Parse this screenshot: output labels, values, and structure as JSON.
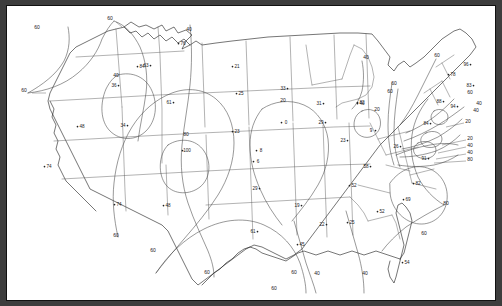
{
  "figure": {
    "type": "contour-map",
    "region": "Contiguous United States",
    "frame_color": "#3d3d3d",
    "background_color": "#ffffff",
    "line_color": "#1a1a1a"
  },
  "chart_data": {
    "type": "contour-map",
    "title": "",
    "subtitle": "",
    "xlabel": "",
    "ylabel": "",
    "grid": false,
    "legend": "none",
    "region": "Contiguous United States",
    "contour_interval": 20,
    "contour_levels": [
      0,
      20,
      40,
      60,
      80
    ],
    "value_range": [
      0,
      100
    ],
    "stations": [
      {
        "label": "76",
        "value": 76,
        "x": 177,
        "y": 40,
        "dot": "left"
      },
      {
        "label": "84",
        "value": 84,
        "x": 136,
        "y": 63,
        "dot": "left"
      },
      {
        "label": "36",
        "value": 36,
        "x": 108,
        "y": 82,
        "dot": "right"
      },
      {
        "label": "63",
        "value": 63,
        "x": 140,
        "y": 62,
        "dot": "right"
      },
      {
        "label": "21",
        "value": 21,
        "x": 231,
        "y": 63,
        "dot": "left"
      },
      {
        "label": "61",
        "value": 61,
        "x": 163,
        "y": 99,
        "dot": "right"
      },
      {
        "label": "25",
        "value": 25,
        "x": 235,
        "y": 90,
        "dot": "left"
      },
      {
        "label": "33",
        "value": 33,
        "x": 277,
        "y": 85,
        "dot": "right"
      },
      {
        "label": "31",
        "value": 31,
        "x": 313,
        "y": 100,
        "dot": "right"
      },
      {
        "label": "40",
        "value": 40,
        "x": 356,
        "y": 100,
        "dot": "left"
      },
      {
        "label": "48",
        "value": 48,
        "x": 76,
        "y": 123,
        "dot": "left"
      },
      {
        "label": "34",
        "value": 34,
        "x": 117,
        "y": 122,
        "dot": "right"
      },
      {
        "label": "23",
        "value": 23,
        "x": 231,
        "y": 128,
        "dot": "left"
      },
      {
        "label": "0",
        "value": 0,
        "x": 280,
        "y": 119,
        "dot": "left"
      },
      {
        "label": "29",
        "value": 29,
        "x": 315,
        "y": 119,
        "dot": "right"
      },
      {
        "label": "23",
        "value": 23,
        "x": 337,
        "y": 137,
        "dot": "right"
      },
      {
        "label": "9",
        "value": 9,
        "x": 365,
        "y": 127,
        "dot": "right"
      },
      {
        "label": "100",
        "value": 100,
        "x": 181,
        "y": 147,
        "dot": "left"
      },
      {
        "label": "8",
        "value": 8,
        "x": 255,
        "y": 147,
        "dot": "left"
      },
      {
        "label": "6",
        "value": 6,
        "x": 252,
        "y": 158,
        "dot": "left"
      },
      {
        "label": "26",
        "value": 26,
        "x": 390,
        "y": 143,
        "dot": "right"
      },
      {
        "label": "84",
        "value": 84,
        "x": 420,
        "y": 120,
        "dot": "right"
      },
      {
        "label": "88",
        "value": 88,
        "x": 433,
        "y": 98,
        "dot": "right"
      },
      {
        "label": "94",
        "value": 94,
        "x": 447,
        "y": 103,
        "dot": "right"
      },
      {
        "label": "74",
        "value": 74,
        "x": 43,
        "y": 163,
        "dot": "left"
      },
      {
        "label": "58",
        "value": 58,
        "x": 360,
        "y": 163,
        "dot": "right"
      },
      {
        "label": "91",
        "value": 91,
        "x": 418,
        "y": 155,
        "dot": "right"
      },
      {
        "label": "29",
        "value": 29,
        "x": 249,
        "y": 185,
        "dot": "right"
      },
      {
        "label": "52",
        "value": 52,
        "x": 348,
        "y": 182,
        "dot": "left"
      },
      {
        "label": "82",
        "value": 82,
        "x": 412,
        "y": 180,
        "dot": "left"
      },
      {
        "label": "74",
        "value": 74,
        "x": 113,
        "y": 201,
        "dot": "left"
      },
      {
        "label": "48",
        "value": 48,
        "x": 162,
        "y": 202,
        "dot": "left"
      },
      {
        "label": "19",
        "value": 19,
        "x": 291,
        "y": 202,
        "dot": "right"
      },
      {
        "label": "69",
        "value": 69,
        "x": 402,
        "y": 196,
        "dot": "left"
      },
      {
        "label": "52",
        "value": 52,
        "x": 376,
        "y": 208,
        "dot": "left"
      },
      {
        "label": "61",
        "value": 61,
        "x": 247,
        "y": 228,
        "dot": "right"
      },
      {
        "label": "22",
        "value": 22,
        "x": 316,
        "y": 221,
        "dot": "right"
      },
      {
        "label": "25",
        "value": 25,
        "x": 346,
        "y": 219,
        "dot": "left"
      },
      {
        "label": "45",
        "value": 45,
        "x": 296,
        "y": 241,
        "dot": "left"
      },
      {
        "label": "54",
        "value": 54,
        "x": 401,
        "y": 259,
        "dot": "left"
      },
      {
        "label": "83",
        "value": 83,
        "x": 463,
        "y": 82,
        "dot": "right"
      },
      {
        "label": "78",
        "value": 78,
        "x": 447,
        "y": 71,
        "dot": "left"
      },
      {
        "label": "96",
        "value": 96,
        "x": 460,
        "y": 61,
        "dot": "right"
      },
      {
        "label": "82",
        "value": 82,
        "x": 356,
        "y": 99,
        "dot": "left"
      }
    ],
    "contour_labels": [
      {
        "text": "60",
        "x": 31,
        "y": 24
      },
      {
        "text": "60",
        "x": 104,
        "y": 15
      },
      {
        "text": "40",
        "x": 183,
        "y": 26
      },
      {
        "text": "40",
        "x": 360,
        "y": 54
      },
      {
        "text": "60",
        "x": 431,
        "y": 52
      },
      {
        "text": "40",
        "x": 110,
        "y": 72
      },
      {
        "text": "60",
        "x": 18,
        "y": 87
      },
      {
        "text": "60",
        "x": 388,
        "y": 80
      },
      {
        "text": "60",
        "x": 384,
        "y": 88
      },
      {
        "text": "20",
        "x": 277,
        "y": 97
      },
      {
        "text": "60",
        "x": 464,
        "y": 89
      },
      {
        "text": "40",
        "x": 473,
        "y": 100
      },
      {
        "text": "20",
        "x": 371,
        "y": 106
      },
      {
        "text": "40",
        "x": 470,
        "y": 107
      },
      {
        "text": "80",
        "x": 180,
        "y": 131
      },
      {
        "text": "20",
        "x": 462,
        "y": 118
      },
      {
        "text": "20",
        "x": 464,
        "y": 135
      },
      {
        "text": "40",
        "x": 464,
        "y": 142
      },
      {
        "text": "40",
        "x": 464,
        "y": 149
      },
      {
        "text": "80",
        "x": 464,
        "y": 156
      },
      {
        "text": "80",
        "x": 440,
        "y": 200
      },
      {
        "text": "60",
        "x": 110,
        "y": 232
      },
      {
        "text": "60",
        "x": 147,
        "y": 247
      },
      {
        "text": "60",
        "x": 418,
        "y": 230
      },
      {
        "text": "60",
        "x": 201,
        "y": 269
      },
      {
        "text": "60",
        "x": 288,
        "y": 269
      },
      {
        "text": "40",
        "x": 311,
        "y": 270
      },
      {
        "text": "40",
        "x": 359,
        "y": 270
      },
      {
        "text": "60",
        "x": 268,
        "y": 285
      }
    ]
  }
}
